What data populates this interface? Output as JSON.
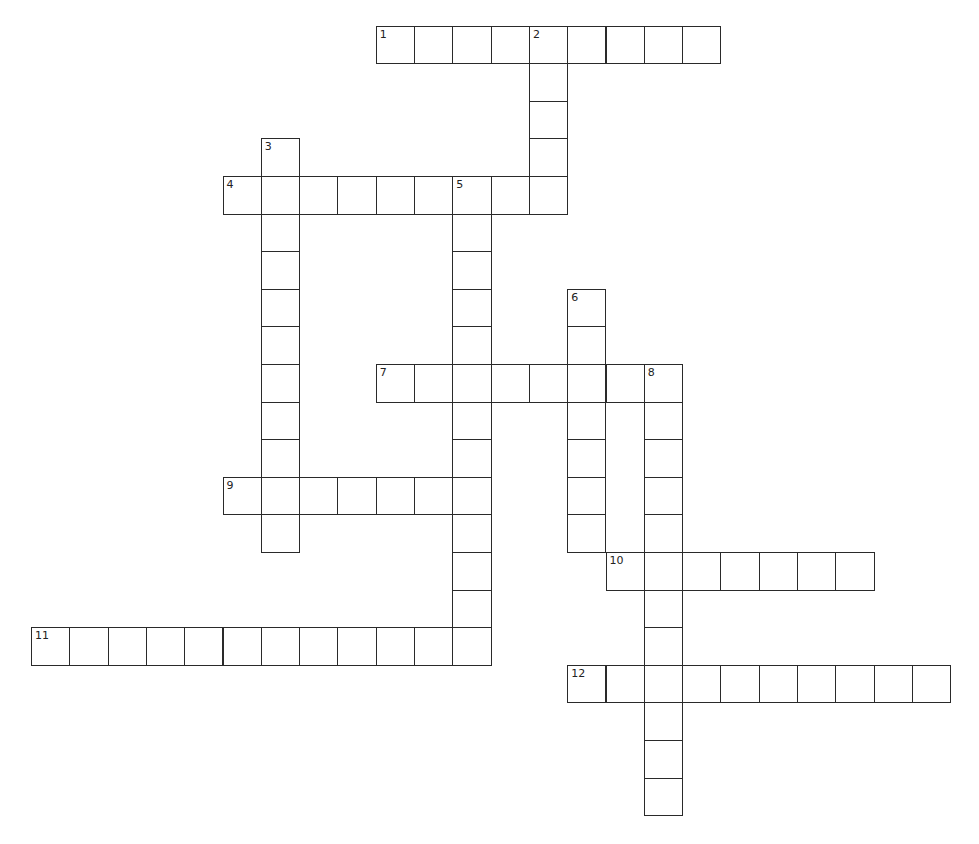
{
  "puzzle": {
    "type": "crossword",
    "layout": {
      "origin_x": 31,
      "origin_y": 25.6,
      "cell_w": 38.3,
      "cell_h": 37.6
    },
    "colors": {
      "line": "#2a2a2a",
      "cell_bg": "#ffffff",
      "page_bg": "#ffffff"
    },
    "words": [
      {
        "number": "1",
        "direction": "across",
        "row": 0,
        "col": 9,
        "length": 9
      },
      {
        "number": "2",
        "direction": "down",
        "row": 0,
        "col": 13,
        "length": 5
      },
      {
        "number": "3",
        "direction": "down",
        "row": 3,
        "col": 6,
        "length": 11
      },
      {
        "number": "4",
        "direction": "across",
        "row": 4,
        "col": 5,
        "length": 9
      },
      {
        "number": "5",
        "direction": "down",
        "row": 4,
        "col": 11,
        "length": 13
      },
      {
        "number": "6",
        "direction": "down",
        "row": 7,
        "col": 14,
        "length": 7
      },
      {
        "number": "7",
        "direction": "across",
        "row": 9,
        "col": 9,
        "length": 8
      },
      {
        "number": "8",
        "direction": "down",
        "row": 9,
        "col": 16,
        "length": 12
      },
      {
        "number": "9",
        "direction": "across",
        "row": 12,
        "col": 5,
        "length": 7
      },
      {
        "number": "10",
        "direction": "across",
        "row": 14,
        "col": 15,
        "length": 7
      },
      {
        "number": "11",
        "direction": "across",
        "row": 16,
        "col": 0,
        "length": 12
      },
      {
        "number": "12",
        "direction": "across",
        "row": 17,
        "col": 14,
        "length": 10
      }
    ]
  }
}
